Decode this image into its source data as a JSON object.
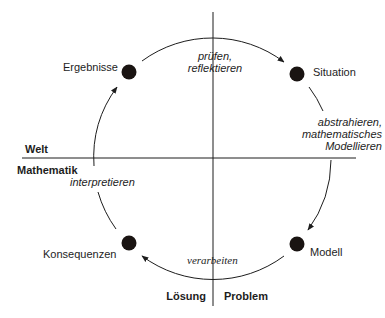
{
  "diagram": {
    "type": "cycle",
    "nodes": [
      {
        "id": "situation",
        "label": "Situation"
      },
      {
        "id": "modell",
        "label": "Modell"
      },
      {
        "id": "konsequenzen",
        "label": "Konsequenzen"
      },
      {
        "id": "ergebnisse",
        "label": "Ergebnisse"
      }
    ],
    "edges": [
      {
        "from": "situation",
        "to": "modell",
        "label_lines": [
          "abstrahieren,",
          "mathematisches",
          "Modellieren"
        ]
      },
      {
        "from": "modell",
        "to": "konsequenzen",
        "label": "verarbeiten"
      },
      {
        "from": "konsequenzen",
        "to": "ergebnisse",
        "label": "interpretieren"
      },
      {
        "from": "ergebnisse",
        "to": "situation",
        "label_lines": [
          "prüfen,",
          "reflektieren"
        ]
      }
    ],
    "domains": {
      "top": "Welt",
      "bottom": "Mathematik",
      "left": "Lösung",
      "right": "Problem"
    },
    "colors": {
      "line": "#1d1d1d",
      "dot": "#1a1412",
      "background": "#ffffff"
    }
  }
}
